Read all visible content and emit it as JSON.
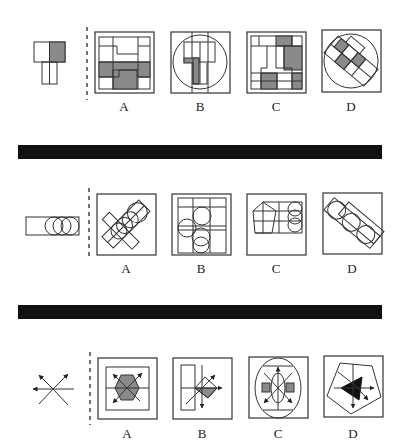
{
  "puzzle": {
    "rows": [
      {
        "id": "row-1",
        "given_figure": "t-shape-with-gray-square",
        "options": [
          {
            "label": "A",
            "figure": "square-grid-with-t-gray"
          },
          {
            "label": "B",
            "figure": "circle-with-t-shape"
          },
          {
            "label": "C",
            "figure": "grid-with-inverted-t"
          },
          {
            "label": "D",
            "figure": "diagonal-t-in-circle"
          }
        ]
      },
      {
        "id": "row-2",
        "given_figure": "rectangle-with-three-circles",
        "options": [
          {
            "label": "A",
            "figure": "crossed-rectangles-with-circles"
          },
          {
            "label": "B",
            "figure": "grid-with-circles"
          },
          {
            "label": "C",
            "figure": "pentagon-with-circles"
          },
          {
            "label": "D",
            "figure": "diagonal-rectangles-with-circles"
          }
        ]
      },
      {
        "id": "row-3",
        "given_figure": "crossing-arrows",
        "options": [
          {
            "label": "A",
            "figure": "hexagon-with-arrows"
          },
          {
            "label": "B",
            "figure": "rectangle-diamond-arrows"
          },
          {
            "label": "C",
            "figure": "ellipse-with-arrows-and-squares"
          },
          {
            "label": "D",
            "figure": "pentagon-with-black-triangle"
          }
        ]
      }
    ],
    "colors": {
      "line": "#333333",
      "gray_fill": "#8a8a8a",
      "black_fill": "#111111",
      "divider": "#111111"
    }
  }
}
